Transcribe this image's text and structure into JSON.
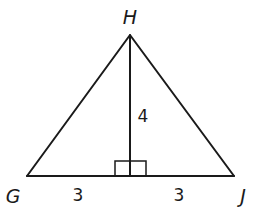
{
  "diagram": {
    "type": "isosceles triangle with altitude",
    "vertices": {
      "apex": "H",
      "left": "G",
      "right": "J"
    },
    "measurements": {
      "altitude": "4",
      "left_base_segment": "3",
      "right_base_segment": "3"
    },
    "right_angle_marker": true,
    "line_color": "#1a1a1a",
    "background_color": "#ffffff"
  }
}
